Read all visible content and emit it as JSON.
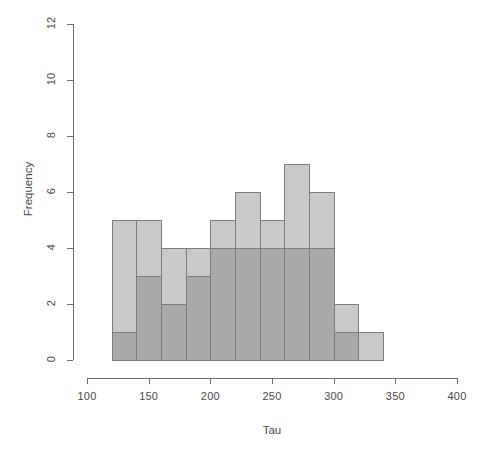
{
  "chart_data": {
    "type": "bar",
    "subtype": "overlapping-histogram",
    "title": "",
    "xlabel": "Tau",
    "ylabel": "Frequency",
    "xlim": [
      100,
      400
    ],
    "ylim": [
      0,
      12
    ],
    "xticks": [
      100,
      150,
      200,
      250,
      300,
      350,
      400
    ],
    "yticks": [
      0,
      2,
      4,
      6,
      8,
      10,
      12
    ],
    "xtick_labels": [
      "100",
      "150",
      "200",
      "250",
      "300",
      "350",
      "400"
    ],
    "ytick_labels": [
      "0",
      "2",
      "4",
      "6",
      "8",
      "10",
      "12"
    ],
    "grid": false,
    "legend": "none",
    "bin_width": 20,
    "bin_edges": [
      120,
      140,
      160,
      180,
      200,
      220,
      240,
      260,
      280,
      300,
      320,
      340
    ],
    "bin_centers": [
      130,
      150,
      170,
      190,
      210,
      230,
      250,
      270,
      290,
      310,
      330
    ],
    "series": [
      {
        "name": "series-a",
        "color": "#c9c9c9",
        "values": [
          5,
          5,
          4,
          4,
          5,
          6,
          5,
          7,
          6,
          2,
          1
        ]
      },
      {
        "name": "series-b",
        "color": "#a9a9a9",
        "values": [
          1,
          3,
          2,
          3,
          4,
          4,
          4,
          4,
          4,
          1,
          0
        ]
      }
    ]
  },
  "axes": {
    "x_title": "Tau",
    "y_title": "Frequency"
  },
  "colors": {
    "series_a": "#c9c9c9",
    "series_b": "#a9a9a9",
    "axis": "#6e6e6e",
    "bar_border": "#7d7d7d",
    "background": "#ffffff"
  }
}
